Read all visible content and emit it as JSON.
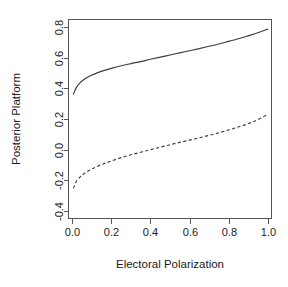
{
  "chart_data": {
    "type": "line",
    "title": "",
    "subtitle": "",
    "xlabel": "Electoral Polarization",
    "ylabel": "Posterior Platform",
    "xlim": [
      -0.02,
      1.02
    ],
    "ylim": [
      -0.45,
      0.85
    ],
    "xticks": [
      0.0,
      0.2,
      0.4,
      0.6,
      0.8,
      1.0
    ],
    "xticklabels": [
      "0.0",
      "0.2",
      "0.4",
      "0.6",
      "0.8",
      "1.0"
    ],
    "yticks": [
      -0.4,
      -0.2,
      0.0,
      0.2,
      0.4,
      0.6,
      0.8
    ],
    "yticklabels": [
      "-0.4",
      "-0.2",
      "0.0",
      "0.2",
      "0.4",
      "0.6",
      "0.8"
    ],
    "grid": false,
    "legend": "none",
    "box": "full",
    "series": [
      {
        "name": "upper-curve",
        "linestyle": "solid",
        "color": "#3c3c3c",
        "x": [
          0.005,
          0.02,
          0.04,
          0.06,
          0.08,
          0.1,
          0.13,
          0.16,
          0.2,
          0.25,
          0.3,
          0.35,
          0.4,
          0.45,
          0.5,
          0.55,
          0.6,
          0.65,
          0.7,
          0.75,
          0.8,
          0.85,
          0.9,
          0.95,
          1.0
        ],
        "y": [
          0.362,
          0.405,
          0.437,
          0.458,
          0.474,
          0.487,
          0.503,
          0.516,
          0.531,
          0.548,
          0.562,
          0.575,
          0.59,
          0.604,
          0.618,
          0.632,
          0.646,
          0.66,
          0.675,
          0.69,
          0.707,
          0.724,
          0.743,
          0.763,
          0.787
        ]
      },
      {
        "name": "lower-curve",
        "linestyle": "dashed",
        "color": "#3c3c3c",
        "x": [
          0.005,
          0.02,
          0.04,
          0.06,
          0.08,
          0.1,
          0.13,
          0.16,
          0.2,
          0.25,
          0.3,
          0.35,
          0.4,
          0.45,
          0.5,
          0.55,
          0.6,
          0.65,
          0.7,
          0.75,
          0.8,
          0.85,
          0.9,
          0.95,
          1.0
        ],
        "y": [
          -0.253,
          -0.208,
          -0.178,
          -0.157,
          -0.14,
          -0.126,
          -0.108,
          -0.092,
          -0.074,
          -0.052,
          -0.034,
          -0.017,
          0.0,
          0.016,
          0.032,
          0.047,
          0.062,
          0.077,
          0.093,
          0.11,
          0.128,
          0.148,
          0.169,
          0.196,
          0.229
        ]
      }
    ]
  }
}
